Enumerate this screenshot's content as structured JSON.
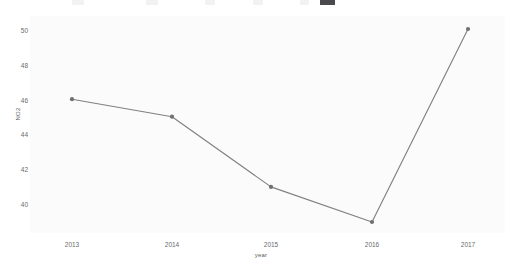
{
  "toolbar": {
    "present": true,
    "note": "cut-off toolbar strip along the top edge; contents illegible"
  },
  "chart_data": {
    "type": "line",
    "title": "",
    "xlabel": "year",
    "ylabel": "NO2",
    "categories": [
      "2013",
      "2014",
      "2015",
      "2016",
      "2017"
    ],
    "values": [
      46,
      45,
      41,
      39,
      50
    ],
    "x_tick_labels": [
      "2013",
      "2014",
      "2015",
      "2016",
      "2017"
    ],
    "y_tick_labels": [
      "40",
      "42",
      "44",
      "46",
      "48",
      "50"
    ],
    "y_tick_values": [
      40,
      42,
      44,
      46,
      48,
      50
    ],
    "ylim": [
      38.6,
      50.6
    ],
    "grid": false,
    "legend": false,
    "marker": "circle",
    "line_color": "#808080",
    "marker_color": "#707070",
    "panel_background": "#fbfbfb",
    "page_background": "#ffffff"
  }
}
